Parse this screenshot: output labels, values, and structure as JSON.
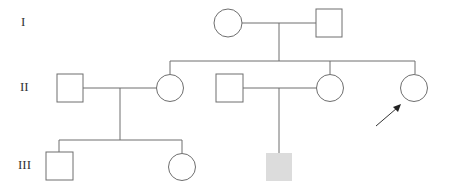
{
  "colors": {
    "line": "#6e6e6e",
    "affected_fill": "#dcdcdc",
    "unaffected_fill": "#ffffff",
    "arrow": "#333333"
  },
  "generations": [
    {
      "label": "I",
      "y": 23
    },
    {
      "label": "II",
      "y": 88
    },
    {
      "label": "III",
      "y": 166
    }
  ],
  "individuals": [
    {
      "id": "I-1",
      "sex": "female",
      "affected": false,
      "cx": 228,
      "cy": 23
    },
    {
      "id": "I-2",
      "sex": "male",
      "affected": false,
      "cx": 329,
      "cy": 23
    },
    {
      "id": "II-1",
      "sex": "male",
      "affected": false,
      "cx": 70,
      "cy": 88
    },
    {
      "id": "II-2",
      "sex": "female",
      "affected": false,
      "cx": 170,
      "cy": 88
    },
    {
      "id": "II-3",
      "sex": "male",
      "affected": false,
      "cx": 229,
      "cy": 88
    },
    {
      "id": "II-4",
      "sex": "female",
      "affected": false,
      "cx": 330,
      "cy": 88
    },
    {
      "id": "II-5",
      "sex": "female",
      "affected": false,
      "proband": true,
      "cx": 414,
      "cy": 88
    },
    {
      "id": "III-1",
      "sex": "male",
      "affected": false,
      "cx": 59,
      "cy": 166
    },
    {
      "id": "III-2",
      "sex": "female",
      "affected": false,
      "cx": 182,
      "cy": 166
    },
    {
      "id": "III-3",
      "sex": "male",
      "affected": true,
      "cx": 279,
      "cy": 167
    }
  ],
  "proband_marker": "arrow pointing to II-5"
}
